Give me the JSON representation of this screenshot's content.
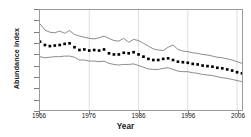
{
  "chart_data": {
    "type": "line",
    "title": "",
    "subtitle": "",
    "xlabel": "Year",
    "ylabel": "Abundance index",
    "xlim": [
      1966,
      2007
    ],
    "ylim": [
      0,
      1.8
    ],
    "grid": "vertical-only",
    "legend": "none",
    "y_ticks": [
      "1.8",
      "1.6",
      "1.4",
      "1.2",
      "1",
      "0.8",
      "0.6",
      "0.4",
      "0.2",
      "0"
    ],
    "y_tick_values": [
      1.8,
      1.6,
      1.4,
      1.2,
      1.0,
      0.8,
      0.6,
      0.4,
      0.2,
      0
    ],
    "x_ticks": [
      "1966",
      "1976",
      "1986",
      "1996",
      "2006"
    ],
    "x_tick_values": [
      1966,
      1976,
      1986,
      1996,
      2006
    ],
    "x": [
      1966,
      1967,
      1968,
      1969,
      1970,
      1971,
      1972,
      1973,
      1974,
      1975,
      1976,
      1977,
      1978,
      1979,
      1980,
      1981,
      1982,
      1983,
      1984,
      1985,
      1986,
      1987,
      1988,
      1989,
      1990,
      1991,
      1992,
      1993,
      1994,
      1995,
      1996,
      1997,
      1998,
      1999,
      2000,
      2001,
      2002,
      2003,
      2004,
      2005,
      2006,
      2007
    ],
    "series": [
      {
        "name": "Upper confidence limit",
        "style": "line",
        "values": [
          1.55,
          1.44,
          1.4,
          1.39,
          1.42,
          1.38,
          1.43,
          1.36,
          1.33,
          1.31,
          1.29,
          1.28,
          1.3,
          1.33,
          1.29,
          1.25,
          1.24,
          1.29,
          1.22,
          1.27,
          1.25,
          1.2,
          1.15,
          1.1,
          1.08,
          1.07,
          1.13,
          1.17,
          1.09,
          1.06,
          1.05,
          1.03,
          1.02,
          1.0,
          0.99,
          0.97,
          0.95,
          0.94,
          0.92,
          0.9,
          0.87,
          0.84
        ]
      },
      {
        "name": "Abundance index",
        "style": "markers",
        "values": [
          1.23,
          1.17,
          1.15,
          1.16,
          1.17,
          1.19,
          1.2,
          1.13,
          1.08,
          1.09,
          1.07,
          1.08,
          1.07,
          1.09,
          1.02,
          1.0,
          1.0,
          1.03,
          1.02,
          1.04,
          1.0,
          0.96,
          0.92,
          0.9,
          0.9,
          0.92,
          0.93,
          0.9,
          0.87,
          0.86,
          0.85,
          0.83,
          0.82,
          0.8,
          0.79,
          0.78,
          0.76,
          0.75,
          0.73,
          0.71,
          0.68,
          0.66
        ]
      },
      {
        "name": "Lower confidence limit",
        "style": "line",
        "values": [
          0.96,
          0.94,
          0.95,
          0.96,
          0.96,
          0.97,
          0.97,
          0.95,
          0.9,
          0.9,
          0.88,
          0.88,
          0.87,
          0.88,
          0.84,
          0.82,
          0.81,
          0.82,
          0.82,
          0.83,
          0.8,
          0.77,
          0.74,
          0.73,
          0.73,
          0.75,
          0.76,
          0.73,
          0.7,
          0.69,
          0.69,
          0.67,
          0.66,
          0.64,
          0.63,
          0.62,
          0.6,
          0.58,
          0.57,
          0.55,
          0.53,
          0.51
        ]
      }
    ],
    "colors": {
      "line": "#5a5a5a",
      "marker": "#000000",
      "frame": "#9a9a9a",
      "gridline": "#c8c8c8",
      "text": "#1a1a1a",
      "background": "#ffffff"
    }
  }
}
